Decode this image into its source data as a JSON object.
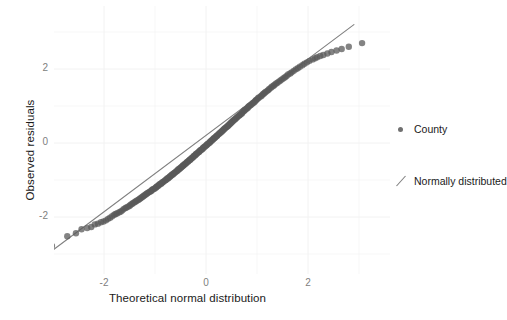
{
  "chart_data": {
    "type": "scatter",
    "title": "",
    "subtitle": "",
    "xlabel": "Theoretical normal distribution",
    "ylabel": "Observed residuals",
    "xlim": [
      -3.3,
      3.3
    ],
    "ylim": [
      -3.3,
      3.3
    ],
    "xticks": [
      -2,
      0,
      2
    ],
    "yticks": [
      -2,
      0,
      2
    ],
    "xticklabels": [
      "-2",
      "0",
      "2"
    ],
    "yticklabels": [
      "-2",
      "0",
      "2"
    ],
    "grid": true,
    "grid_color": "#f2f2f2",
    "panel_background": "#ffffff",
    "legend_position": "right",
    "legend": [
      {
        "label": "County",
        "marker": "point",
        "color": "#707070"
      },
      {
        "label": "Normally distributed",
        "marker": "line",
        "color": "#808080"
      }
    ],
    "series": [
      {
        "name": "County",
        "type": "scatter",
        "marker": "circle",
        "marker_size": 3.2,
        "color": "#595959",
        "opacity": 0.75,
        "points": [
          [
            -3.02,
            -2.78
          ],
          [
            -2.72,
            -2.52
          ],
          [
            -2.55,
            -2.44
          ],
          [
            -2.44,
            -2.33
          ],
          [
            -2.33,
            -2.3
          ],
          [
            -2.25,
            -2.27
          ],
          [
            -2.18,
            -2.2
          ],
          [
            -2.12,
            -2.18
          ],
          [
            -2.06,
            -2.14
          ],
          [
            -2.01,
            -2.12
          ],
          [
            -1.96,
            -2.09
          ],
          [
            -1.92,
            -2.05
          ],
          [
            -1.88,
            -2.02
          ],
          [
            -1.84,
            -1.98
          ],
          [
            -1.8,
            -1.94
          ],
          [
            -1.77,
            -1.92
          ],
          [
            -1.74,
            -1.9
          ],
          [
            -1.7,
            -1.87
          ],
          [
            -1.67,
            -1.85
          ],
          [
            -1.64,
            -1.82
          ],
          [
            -1.61,
            -1.78
          ],
          [
            -1.58,
            -1.76
          ],
          [
            -1.56,
            -1.74
          ],
          [
            -1.53,
            -1.72
          ],
          [
            -1.5,
            -1.7
          ],
          [
            -1.48,
            -1.67
          ],
          [
            -1.45,
            -1.65
          ],
          [
            -1.43,
            -1.62
          ],
          [
            -1.4,
            -1.6
          ],
          [
            -1.38,
            -1.58
          ],
          [
            -1.36,
            -1.56
          ],
          [
            -1.33,
            -1.54
          ],
          [
            -1.31,
            -1.52
          ],
          [
            -1.29,
            -1.5
          ],
          [
            -1.27,
            -1.48
          ],
          [
            -1.25,
            -1.46
          ],
          [
            -1.23,
            -1.44
          ],
          [
            -1.21,
            -1.42
          ],
          [
            -1.19,
            -1.4
          ],
          [
            -1.17,
            -1.38
          ],
          [
            -1.15,
            -1.36
          ],
          [
            -1.13,
            -1.34
          ],
          [
            -1.11,
            -1.32
          ],
          [
            -1.09,
            -1.31
          ],
          [
            -1.07,
            -1.29
          ],
          [
            -1.06,
            -1.27
          ],
          [
            -1.04,
            -1.25
          ],
          [
            -1.02,
            -1.24
          ],
          [
            -1.0,
            -1.22
          ],
          [
            -0.98,
            -1.2
          ],
          [
            -0.97,
            -1.18
          ],
          [
            -0.95,
            -1.17
          ],
          [
            -0.93,
            -1.15
          ],
          [
            -0.92,
            -1.13
          ],
          [
            -0.9,
            -1.11
          ],
          [
            -0.88,
            -1.1
          ],
          [
            -0.87,
            -1.08
          ],
          [
            -0.85,
            -1.06
          ],
          [
            -0.84,
            -1.05
          ],
          [
            -0.82,
            -1.03
          ],
          [
            -0.8,
            -1.01
          ],
          [
            -0.79,
            -1.0
          ],
          [
            -0.77,
            -0.98
          ],
          [
            -0.76,
            -0.96
          ],
          [
            -0.74,
            -0.95
          ],
          [
            -0.73,
            -0.93
          ],
          [
            -0.71,
            -0.91
          ],
          [
            -0.7,
            -0.9
          ],
          [
            -0.68,
            -0.88
          ],
          [
            -0.67,
            -0.86
          ],
          [
            -0.65,
            -0.85
          ],
          [
            -0.64,
            -0.83
          ],
          [
            -0.62,
            -0.81
          ],
          [
            -0.61,
            -0.8
          ],
          [
            -0.59,
            -0.78
          ],
          [
            -0.58,
            -0.76
          ],
          [
            -0.56,
            -0.75
          ],
          [
            -0.55,
            -0.73
          ],
          [
            -0.54,
            -0.71
          ],
          [
            -0.52,
            -0.7
          ],
          [
            -0.51,
            -0.68
          ],
          [
            -0.49,
            -0.66
          ],
          [
            -0.48,
            -0.65
          ],
          [
            -0.46,
            -0.63
          ],
          [
            -0.45,
            -0.61
          ],
          [
            -0.44,
            -0.6
          ],
          [
            -0.42,
            -0.58
          ],
          [
            -0.41,
            -0.56
          ],
          [
            -0.39,
            -0.55
          ],
          [
            -0.38,
            -0.53
          ],
          [
            -0.37,
            -0.51
          ],
          [
            -0.35,
            -0.5
          ],
          [
            -0.34,
            -0.48
          ],
          [
            -0.32,
            -0.46
          ],
          [
            -0.31,
            -0.45
          ],
          [
            -0.3,
            -0.43
          ],
          [
            -0.28,
            -0.41
          ],
          [
            -0.27,
            -0.4
          ],
          [
            -0.25,
            -0.38
          ],
          [
            -0.24,
            -0.36
          ],
          [
            -0.23,
            -0.34
          ],
          [
            -0.21,
            -0.33
          ],
          [
            -0.2,
            -0.31
          ],
          [
            -0.19,
            -0.29
          ],
          [
            -0.17,
            -0.28
          ],
          [
            -0.16,
            -0.26
          ],
          [
            -0.14,
            -0.24
          ],
          [
            -0.13,
            -0.23
          ],
          [
            -0.12,
            -0.21
          ],
          [
            -0.1,
            -0.19
          ],
          [
            -0.09,
            -0.18
          ],
          [
            -0.07,
            -0.16
          ],
          [
            -0.06,
            -0.14
          ],
          [
            -0.05,
            -0.12
          ],
          [
            -0.03,
            -0.11
          ],
          [
            -0.02,
            -0.09
          ],
          [
            0.0,
            -0.07
          ],
          [
            0.01,
            -0.06
          ],
          [
            0.02,
            -0.04
          ],
          [
            0.04,
            -0.02
          ],
          [
            0.05,
            -0.01
          ],
          [
            0.07,
            0.01
          ],
          [
            0.08,
            0.03
          ],
          [
            0.09,
            0.05
          ],
          [
            0.11,
            0.06
          ],
          [
            0.12,
            0.08
          ],
          [
            0.14,
            0.1
          ],
          [
            0.15,
            0.12
          ],
          [
            0.16,
            0.13
          ],
          [
            0.18,
            0.15
          ],
          [
            0.19,
            0.17
          ],
          [
            0.21,
            0.19
          ],
          [
            0.22,
            0.2
          ],
          [
            0.23,
            0.22
          ],
          [
            0.25,
            0.24
          ],
          [
            0.26,
            0.26
          ],
          [
            0.28,
            0.28
          ],
          [
            0.29,
            0.29
          ],
          [
            0.31,
            0.31
          ],
          [
            0.32,
            0.33
          ],
          [
            0.34,
            0.35
          ],
          [
            0.35,
            0.37
          ],
          [
            0.37,
            0.39
          ],
          [
            0.38,
            0.41
          ],
          [
            0.4,
            0.43
          ],
          [
            0.41,
            0.44
          ],
          [
            0.43,
            0.46
          ],
          [
            0.44,
            0.48
          ],
          [
            0.46,
            0.5
          ],
          [
            0.47,
            0.52
          ],
          [
            0.49,
            0.54
          ],
          [
            0.5,
            0.56
          ],
          [
            0.52,
            0.58
          ],
          [
            0.53,
            0.6
          ],
          [
            0.55,
            0.62
          ],
          [
            0.57,
            0.64
          ],
          [
            0.58,
            0.66
          ],
          [
            0.6,
            0.68
          ],
          [
            0.61,
            0.7
          ],
          [
            0.63,
            0.72
          ],
          [
            0.65,
            0.74
          ],
          [
            0.66,
            0.76
          ],
          [
            0.68,
            0.78
          ],
          [
            0.7,
            0.8
          ],
          [
            0.71,
            0.82
          ],
          [
            0.73,
            0.85
          ],
          [
            0.75,
            0.87
          ],
          [
            0.76,
            0.89
          ],
          [
            0.78,
            0.91
          ],
          [
            0.8,
            0.93
          ],
          [
            0.82,
            0.95
          ],
          [
            0.83,
            0.98
          ],
          [
            0.85,
            1.0
          ],
          [
            0.87,
            1.02
          ],
          [
            0.89,
            1.04
          ],
          [
            0.91,
            1.07
          ],
          [
            0.93,
            1.09
          ],
          [
            0.95,
            1.11
          ],
          [
            0.97,
            1.14
          ],
          [
            0.98,
            1.16
          ],
          [
            1.0,
            1.18
          ],
          [
            1.02,
            1.21
          ],
          [
            1.04,
            1.23
          ],
          [
            1.07,
            1.26
          ],
          [
            1.09,
            1.28
          ],
          [
            1.11,
            1.31
          ],
          [
            1.13,
            1.33
          ],
          [
            1.15,
            1.36
          ],
          [
            1.17,
            1.38
          ],
          [
            1.2,
            1.41
          ],
          [
            1.22,
            1.43
          ],
          [
            1.24,
            1.46
          ],
          [
            1.27,
            1.49
          ],
          [
            1.29,
            1.52
          ],
          [
            1.32,
            1.54
          ],
          [
            1.34,
            1.57
          ],
          [
            1.37,
            1.6
          ],
          [
            1.4,
            1.63
          ],
          [
            1.43,
            1.66
          ],
          [
            1.46,
            1.69
          ],
          [
            1.49,
            1.72
          ],
          [
            1.52,
            1.75
          ],
          [
            1.55,
            1.78
          ],
          [
            1.58,
            1.81
          ],
          [
            1.61,
            1.85
          ],
          [
            1.65,
            1.88
          ],
          [
            1.68,
            1.91
          ],
          [
            1.72,
            1.95
          ],
          [
            1.76,
            1.99
          ],
          [
            1.8,
            2.02
          ],
          [
            1.84,
            2.06
          ],
          [
            1.89,
            2.1
          ],
          [
            1.93,
            2.14
          ],
          [
            1.98,
            2.18
          ],
          [
            2.03,
            2.22
          ],
          [
            2.09,
            2.26
          ],
          [
            2.14,
            2.29
          ],
          [
            2.18,
            2.32
          ],
          [
            2.24,
            2.35
          ],
          [
            2.3,
            2.38
          ],
          [
            2.38,
            2.42
          ],
          [
            2.46,
            2.46
          ],
          [
            2.56,
            2.5
          ],
          [
            2.66,
            2.54
          ],
          [
            2.8,
            2.6
          ],
          [
            3.06,
            2.7
          ]
        ],
        "tail_note": "lower tail points lie above the reference line; upper tail points lie below it"
      },
      {
        "name": "Normally distributed",
        "type": "line",
        "color": "#808080",
        "linewidth": 1.1,
        "endpoints": [
          [
            -3.2,
            -3.1
          ],
          [
            2.9,
            3.2
          ]
        ]
      }
    ]
  }
}
